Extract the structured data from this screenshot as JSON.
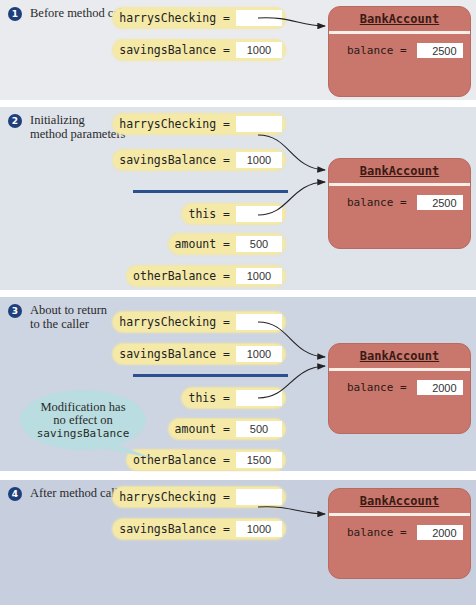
{
  "steps": [
    {
      "number": "1",
      "label_lines": [
        "Before method call"
      ],
      "bg": "#e9ebee",
      "vars": [
        {
          "name": "harrysChecking =",
          "value": ""
        },
        {
          "name": "savingsBalance =",
          "value": "1000"
        }
      ],
      "object": {
        "title": "BankAccount",
        "field": "balance =",
        "value": "2500"
      }
    },
    {
      "number": "2",
      "label_lines": [
        "Initializing",
        "method parameters"
      ],
      "bg": "#dfe3ea",
      "vars": [
        {
          "name": "harrysChecking =",
          "value": ""
        },
        {
          "name": "savingsBalance =",
          "value": "1000"
        },
        {
          "name": "this =",
          "value": ""
        },
        {
          "name": "amount =",
          "value": "500"
        },
        {
          "name": "otherBalance =",
          "value": "1000"
        }
      ],
      "object": {
        "title": "BankAccount",
        "field": "balance =",
        "value": "2500"
      }
    },
    {
      "number": "3",
      "label_lines": [
        "About to return",
        "to the caller"
      ],
      "bg": "#cdd4e2",
      "vars": [
        {
          "name": "harrysChecking =",
          "value": ""
        },
        {
          "name": "savingsBalance =",
          "value": "1000"
        },
        {
          "name": "this =",
          "value": ""
        },
        {
          "name": "amount =",
          "value": "500"
        },
        {
          "name": "otherBalance =",
          "value": "1500"
        }
      ],
      "object": {
        "title": "BankAccount",
        "field": "balance =",
        "value": "2000"
      },
      "callout": {
        "line1": "Modification has",
        "line2": "no effect on",
        "line3": "savingsBalance"
      }
    },
    {
      "number": "4",
      "label_lines": [
        "After method call"
      ],
      "bg": "#c7cfdf",
      "vars": [
        {
          "name": "harrysChecking =",
          "value": ""
        },
        {
          "name": "savingsBalance =",
          "value": "1000"
        }
      ],
      "object": {
        "title": "BankAccount",
        "field": "balance =",
        "value": "2000"
      }
    }
  ],
  "colors": {
    "variable_pill": "#f5e9a8",
    "object_box": "#c9776c",
    "badge": "#1f3f7a",
    "divider": "#2b4f8f",
    "callout": "#b9dde0"
  }
}
